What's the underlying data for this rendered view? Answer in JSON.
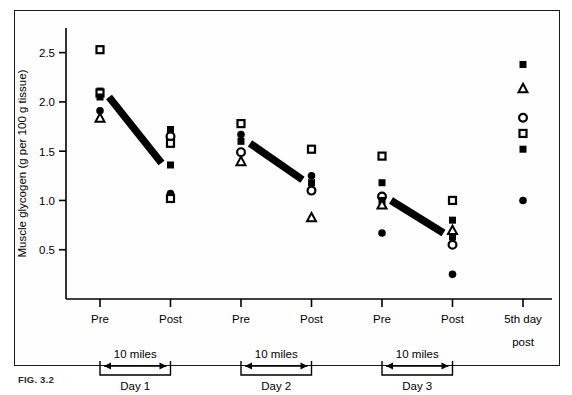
{
  "figure": {
    "caption_id": "FIG. 3.2",
    "axes": {
      "ylabel": "Muscle glycogen (g per 100 g tissue)",
      "yticks": [
        "0.5",
        "1.0",
        "1.5",
        "2.0",
        "2.5"
      ],
      "xtick_labels": [
        "Pre",
        "Post",
        "Pre",
        "Post",
        "Pre",
        "Post",
        "5th day"
      ],
      "xtick_sublabel": "post"
    },
    "brackets": [
      {
        "distance_label": "10 miles",
        "day_label": "Day 1"
      },
      {
        "distance_label": "10 miles",
        "day_label": "Day 2"
      },
      {
        "distance_label": "10 miles",
        "day_label": "Day 3"
      }
    ],
    "colors": {
      "ink": "#000000",
      "frame": "#1a1a1a",
      "trend": "#000000"
    }
  },
  "chart_data": {
    "type": "scatter",
    "title": "",
    "xlabel": "",
    "ylabel": "Muscle glycogen (g per 100 g tissue)",
    "ylim": [
      0.0,
      2.75
    ],
    "yticks": [
      0.5,
      1.0,
      1.5,
      2.0,
      2.5
    ],
    "grid": false,
    "legend": "none",
    "categories": [
      "Pre",
      "Post",
      "Pre",
      "Post",
      "Pre",
      "Post",
      "5th day post"
    ],
    "marker_styles": {
      "filled-square": "subject A",
      "open-square": "subject B",
      "filled-circle": "subject C",
      "open-circle": "subject D",
      "open-triangle": "subject E"
    },
    "points": [
      {
        "x": 1,
        "category": "Pre",
        "day": "Day 1",
        "marker": "open-square",
        "y": 2.53
      },
      {
        "x": 1,
        "category": "Pre",
        "day": "Day 1",
        "marker": "filled-square",
        "y": 2.11
      },
      {
        "x": 1,
        "category": "Pre",
        "day": "Day 1",
        "marker": "open-square",
        "y": 2.09
      },
      {
        "x": 1,
        "category": "Pre",
        "day": "Day 1",
        "marker": "filled-square",
        "y": 2.05
      },
      {
        "x": 1,
        "category": "Pre",
        "day": "Day 1",
        "marker": "filled-circle",
        "y": 1.91
      },
      {
        "x": 1,
        "category": "Pre",
        "day": "Day 1",
        "marker": "open-triangle",
        "y": 1.84
      },
      {
        "x": 2,
        "category": "Post",
        "day": "Day 1",
        "marker": "filled-square",
        "y": 1.72
      },
      {
        "x": 2,
        "category": "Post",
        "day": "Day 1",
        "marker": "open-circle",
        "y": 1.65
      },
      {
        "x": 2,
        "category": "Post",
        "day": "Day 1",
        "marker": "open-square",
        "y": 1.58
      },
      {
        "x": 2,
        "category": "Post",
        "day": "Day 1",
        "marker": "filled-square",
        "y": 1.36
      },
      {
        "x": 2,
        "category": "Post",
        "day": "Day 1",
        "marker": "filled-circle",
        "y": 1.07
      },
      {
        "x": 2,
        "category": "Post",
        "day": "Day 1",
        "marker": "open-square",
        "y": 1.02
      },
      {
        "x": 3,
        "category": "Pre",
        "day": "Day 2",
        "marker": "open-square",
        "y": 1.78
      },
      {
        "x": 3,
        "category": "Pre",
        "day": "Day 2",
        "marker": "filled-circle",
        "y": 1.67
      },
      {
        "x": 3,
        "category": "Pre",
        "day": "Day 2",
        "marker": "filled-square",
        "y": 1.6
      },
      {
        "x": 3,
        "category": "Pre",
        "day": "Day 2",
        "marker": "open-circle",
        "y": 1.49
      },
      {
        "x": 3,
        "category": "Pre",
        "day": "Day 2",
        "marker": "open-triangle",
        "y": 1.4
      },
      {
        "x": 4,
        "category": "Post",
        "day": "Day 2",
        "marker": "open-square",
        "y": 1.52
      },
      {
        "x": 4,
        "category": "Post",
        "day": "Day 2",
        "marker": "filled-circle",
        "y": 1.25
      },
      {
        "x": 4,
        "category": "Post",
        "day": "Day 2",
        "marker": "filled-square",
        "y": 1.18
      },
      {
        "x": 4,
        "category": "Post",
        "day": "Day 2",
        "marker": "open-circle",
        "y": 1.1
      },
      {
        "x": 4,
        "category": "Post",
        "day": "Day 2",
        "marker": "open-triangle",
        "y": 0.83
      },
      {
        "x": 5,
        "category": "Pre",
        "day": "Day 3",
        "marker": "open-square",
        "y": 1.45
      },
      {
        "x": 5,
        "category": "Pre",
        "day": "Day 3",
        "marker": "filled-square",
        "y": 1.18
      },
      {
        "x": 5,
        "category": "Pre",
        "day": "Day 3",
        "marker": "open-circle",
        "y": 1.04
      },
      {
        "x": 5,
        "category": "Pre",
        "day": "Day 3",
        "marker": "filled-square",
        "y": 1.0
      },
      {
        "x": 5,
        "category": "Pre",
        "day": "Day 3",
        "marker": "open-triangle",
        "y": 0.96
      },
      {
        "x": 5,
        "category": "Pre",
        "day": "Day 3",
        "marker": "filled-circle",
        "y": 0.67
      },
      {
        "x": 6,
        "category": "Post",
        "day": "Day 3",
        "marker": "open-square",
        "y": 1.0
      },
      {
        "x": 6,
        "category": "Post",
        "day": "Day 3",
        "marker": "filled-square",
        "y": 0.8
      },
      {
        "x": 6,
        "category": "Post",
        "day": "Day 3",
        "marker": "open-triangle",
        "y": 0.7
      },
      {
        "x": 6,
        "category": "Post",
        "day": "Day 3",
        "marker": "filled-square",
        "y": 0.63
      },
      {
        "x": 6,
        "category": "Post",
        "day": "Day 3",
        "marker": "open-circle",
        "y": 0.55
      },
      {
        "x": 6,
        "category": "Post",
        "day": "Day 3",
        "marker": "filled-circle",
        "y": 0.25
      },
      {
        "x": 7,
        "category": "5th day post",
        "day": "5th day",
        "marker": "filled-square",
        "y": 2.38
      },
      {
        "x": 7,
        "category": "5th day post",
        "day": "5th day",
        "marker": "open-triangle",
        "y": 2.14
      },
      {
        "x": 7,
        "category": "5th day post",
        "day": "5th day",
        "marker": "open-circle",
        "y": 1.84
      },
      {
        "x": 7,
        "category": "5th day post",
        "day": "5th day",
        "marker": "open-square",
        "y": 1.68
      },
      {
        "x": 7,
        "category": "5th day post",
        "day": "5th day",
        "marker": "filled-square",
        "y": 1.52
      },
      {
        "x": 7,
        "category": "5th day post",
        "day": "5th day",
        "marker": "filled-circle",
        "y": 1.0
      }
    ],
    "trend_lines": [
      {
        "day": "Day 1",
        "from": {
          "x": 1,
          "y": 2.05
        },
        "to": {
          "x": 2,
          "y": 1.38
        }
      },
      {
        "day": "Day 2",
        "from": {
          "x": 3,
          "y": 1.58
        },
        "to": {
          "x": 4,
          "y": 1.21
        }
      },
      {
        "day": "Day 3",
        "from": {
          "x": 5,
          "y": 1.0
        },
        "to": {
          "x": 6,
          "y": 0.67
        }
      }
    ]
  }
}
